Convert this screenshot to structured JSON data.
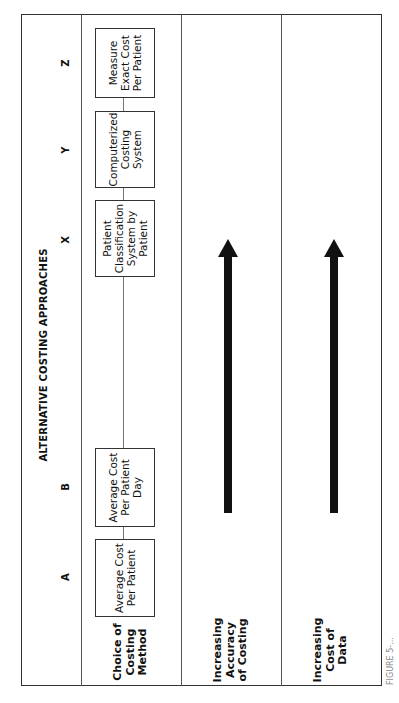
{
  "diagram": {
    "title": "ALTERNATIVE COSTING APPROACHES",
    "orientation": "rotated 90 degrees counter-clockwise",
    "approaches": [
      {
        "letter": "A",
        "label": "Average Cost Per Patient"
      },
      {
        "letter": "B",
        "label": "Average Cost Per Patient Day"
      },
      {
        "letter": "X",
        "label": "Patient Classification System by Patient"
      },
      {
        "letter": "Y",
        "label": "Computerized Costing System"
      },
      {
        "letter": "Z",
        "label": "Measure Exact Cost Per Patient"
      }
    ],
    "rows": [
      {
        "label": "Choice of Costing Method",
        "content": "approach boxes connected by line"
      },
      {
        "label": "Increasing Accuracy of Costing",
        "content": "arrow pointing from A toward Z"
      },
      {
        "label": "Increasing Cost of Data",
        "content": "arrow pointing from A toward Z"
      }
    ],
    "caption": "FIGURE 5-..."
  },
  "labels": {
    "title": "ALTERNATIVE COSTING APPROACHES",
    "letter_a": "A",
    "letter_b": "B",
    "letter_x": "X",
    "letter_y": "Y",
    "letter_z": "Z",
    "box_a": "Average Cost Per Patient",
    "box_b": "Average Cost Per Patient Day",
    "box_x": "Patient Classification System by Patient",
    "box_y": "Computerized Costing System",
    "box_z": "Measure Exact Cost Per Patient",
    "row1_label": "Choice of Costing Method",
    "row2_label": "Increasing Accuracy of Costing",
    "row3_label": "Increasing Cost of Data",
    "caption": "FIGURE 5-..."
  }
}
